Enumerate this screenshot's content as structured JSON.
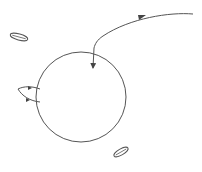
{
  "diagram": {
    "background": "#ffffff",
    "stroke_color": "#555555",
    "circle": {
      "cx": 81,
      "cy": 97,
      "r": 45
    },
    "trajectory_arrow": {
      "path": "M193,14 C170,12 130,18 103,36 C97,40 95,44 94,48 L93,68",
      "head_mid": {
        "x": 142,
        "y": 16
      },
      "head_end": {
        "x": 93,
        "y": 70
      }
    },
    "side_loop": {
      "path": "M40,89 C32,86 24,86 18,89 C22,96 30,101 40,102"
    },
    "particles": [
      {
        "name": "particle-upper-left",
        "cx": 19,
        "cy": 37,
        "rx": 9,
        "ry": 3,
        "rotate": 15
      },
      {
        "name": "particle-lower-right",
        "cx": 121,
        "cy": 152,
        "rx": 8,
        "ry": 3,
        "rotate": -30
      }
    ]
  }
}
